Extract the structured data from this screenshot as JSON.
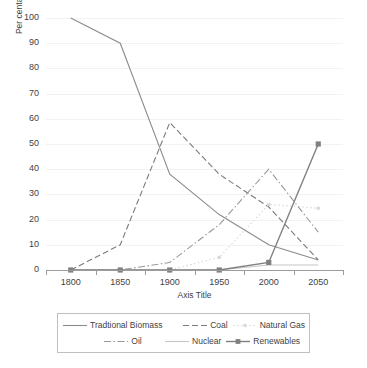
{
  "chart_data": {
    "type": "line",
    "title": "",
    "xlabel": "Axis Title",
    "ylabel": "Per centahge share",
    "x": [
      1800,
      1850,
      1900,
      1950,
      2000,
      2050
    ],
    "xtick_labels": [
      "1800",
      "1850",
      "1900",
      "1950",
      "2000",
      "2050"
    ],
    "ytick_labels": [
      "0",
      "10",
      "20",
      "30",
      "40",
      "50",
      "60",
      "70",
      "80",
      "90",
      "100"
    ],
    "xlim": [
      1775,
      2075
    ],
    "ylim": [
      0,
      100
    ],
    "grid": "horizontal",
    "legend_position": "bottom",
    "series": [
      {
        "name": "Tradtional Biomass",
        "style": "solid",
        "color": "#8c8c8c",
        "marker": "none",
        "values": [
          100,
          90,
          38,
          22,
          10,
          4
        ]
      },
      {
        "name": "Coal",
        "style": "dashed",
        "color": "#7a7a7a",
        "marker": "none",
        "values": [
          0,
          10,
          58.5,
          38,
          25,
          4
        ]
      },
      {
        "name": "Natural Gas",
        "style": "dotted",
        "color": "#d9d9d9",
        "marker": "small-square",
        "values": [
          0,
          0,
          0,
          5,
          26,
          24.5
        ]
      },
      {
        "name": "Oil",
        "style": "dashdot",
        "color": "#9a9a9a",
        "marker": "none",
        "values": [
          0,
          0,
          3,
          18,
          40,
          15
        ]
      },
      {
        "name": "Nuclear",
        "style": "solid-light",
        "color": "#c6c6c6",
        "marker": "none",
        "values": [
          0,
          0,
          0,
          0,
          2,
          2
        ]
      },
      {
        "name": "Renewables",
        "style": "solid-marker",
        "color": "#808080",
        "marker": "square",
        "values": [
          0,
          0,
          0,
          0,
          3,
          50
        ]
      }
    ]
  },
  "legend": {
    "rows": [
      [
        {
          "label": "Tradtional Biomass",
          "series": 0
        },
        {
          "label": "Coal",
          "series": 1
        },
        {
          "label": "Natural Gas",
          "series": 2
        }
      ],
      [
        {
          "label": "Oil",
          "series": 3
        },
        {
          "label": "Nuclear",
          "series": 4
        },
        {
          "label": "Renewables",
          "series": 5
        }
      ]
    ]
  },
  "colors": {
    "gridline": "#f2f2f2",
    "axis": "#9c9c9c",
    "text": "#3f3f3f",
    "legend_border": "#bfbfbf",
    "background": "#ffffff"
  }
}
